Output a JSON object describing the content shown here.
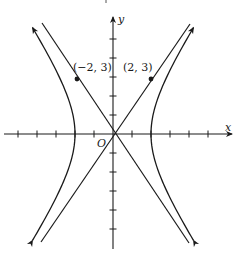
{
  "figure": {
    "type": "hyperbola-graph",
    "equation_implied": "x^2/4 - y^2/9 = 1",
    "asymptotes": [
      "y = 3/2 x",
      "y = -3/2 x"
    ],
    "axes": {
      "x_label": "x",
      "y_label": "y",
      "origin_label": "O",
      "x_ticks": [
        -5,
        -4,
        -3,
        -2,
        -1,
        1,
        2,
        3,
        4,
        5
      ],
      "y_ticks": [
        -5,
        -4,
        -3,
        -2,
        -1,
        1,
        2,
        3,
        4,
        5
      ]
    },
    "points": [
      {
        "label": "(−2, 3)",
        "x": -2,
        "y": 3
      },
      {
        "label": "(2, 3)",
        "x": 2,
        "y": 3
      }
    ],
    "vertices": [
      {
        "x": -2,
        "y": 0
      },
      {
        "x": 2,
        "y": 0
      }
    ],
    "colors": {
      "ink": "#1a1a1a",
      "background": "#ffffff"
    }
  }
}
